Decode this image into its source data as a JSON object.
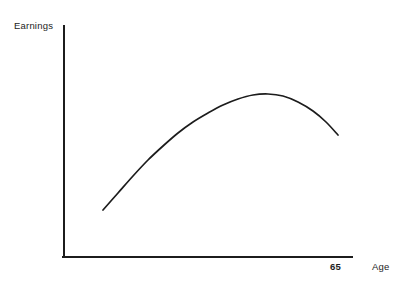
{
  "chart_data": {
    "type": "line",
    "title": "",
    "subtitle": "",
    "xlabel": "Age",
    "ylabel": "Earnings",
    "xticklabels": [
      "65"
    ],
    "yticklabels": [],
    "grid": false,
    "legend": null,
    "annotations": [],
    "axis_color": "#1c1c1c",
    "curve_color": "#1c1c1c",
    "background": "#ffffff",
    "axes": {
      "x_axis_start_px": [
        64,
        257
      ],
      "x_axis_end_px": [
        352,
        257
      ],
      "y_axis_start_px": [
        64,
        257
      ],
      "y_axis_end_px": [
        64,
        26
      ],
      "arrowheads": false,
      "ticks_drawn": false
    },
    "xlim_px": [
      64,
      352
    ],
    "ylim_px": [
      257,
      26
    ],
    "series": [
      {
        "name": "Age-earnings profile",
        "points_px": [
          [
            103,
            210
          ],
          [
            118,
            193
          ],
          [
            133,
            176
          ],
          [
            148,
            160
          ],
          [
            163,
            146
          ],
          [
            178,
            133
          ],
          [
            193,
            122
          ],
          [
            208,
            113
          ],
          [
            223,
            105
          ],
          [
            238,
            99
          ],
          [
            253,
            95
          ],
          [
            268,
            94
          ],
          [
            283,
            96
          ],
          [
            298,
            102
          ],
          [
            313,
            111
          ],
          [
            326,
            122
          ],
          [
            338,
            135
          ]
        ],
        "peak_px": [
          268,
          94
        ],
        "start_px": [
          103,
          210
        ],
        "end_px": [
          338,
          135
        ]
      }
    ]
  },
  "labels": {
    "y_axis": "Earnings",
    "x_axis": "Age",
    "x_tick_retirement": "65"
  }
}
